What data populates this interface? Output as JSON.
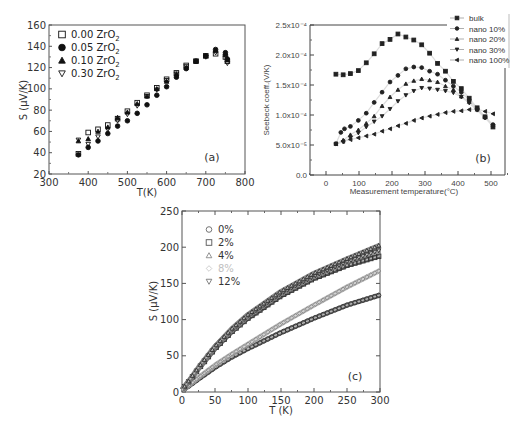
{
  "chart_data": [
    {
      "panel": "(a)",
      "type": "scatter",
      "title": "",
      "xlabel": "T(K)",
      "ylabel": "S (μV/K)",
      "xlim": [
        300,
        800
      ],
      "ylim": [
        20,
        160
      ],
      "xticks": [
        300,
        400,
        500,
        600,
        700,
        800
      ],
      "yticks": [
        20,
        40,
        60,
        80,
        100,
        120,
        140,
        160
      ],
      "grid": false,
      "legend_position": "upper left",
      "series": [
        {
          "name": "0.00 ZrO₂",
          "marker": "open-square",
          "x": [
            375,
            400,
            425,
            450,
            475,
            500,
            525,
            550,
            575,
            600,
            625,
            650,
            675,
            700,
            725,
            750,
            755
          ],
          "y": [
            39,
            59,
            62,
            66,
            72,
            79,
            87,
            94,
            101,
            109,
            115,
            122,
            126,
            131,
            133,
            130,
            126
          ]
        },
        {
          "name": "0.05 ZrO₂",
          "marker": "filled-circle",
          "x": [
            375,
            400,
            425,
            450,
            475,
            500,
            525,
            550,
            575,
            600,
            625,
            650,
            675,
            700,
            725,
            750,
            755
          ],
          "y": [
            38,
            45,
            51,
            58,
            65,
            70,
            77,
            85,
            94,
            102,
            111,
            119,
            126,
            131,
            137,
            134,
            128
          ]
        },
        {
          "name": "0.10 ZrO₂",
          "marker": "filled-triangle",
          "x": [
            375,
            400,
            425,
            450,
            475,
            500,
            525,
            550,
            575,
            600,
            625,
            650,
            675,
            700,
            725,
            750,
            755
          ],
          "y": [
            51,
            53,
            60,
            64,
            73,
            78,
            86,
            93,
            100,
            107,
            114,
            120,
            126,
            131,
            136,
            132,
            127
          ]
        },
        {
          "name": "0.30 ZrO₂",
          "marker": "open-triangle-down",
          "x": [
            375,
            400,
            425,
            450,
            475,
            500,
            525,
            550,
            575,
            600,
            625,
            650,
            675,
            700,
            725,
            750,
            755
          ],
          "y": [
            52,
            48,
            55,
            62,
            70,
            76,
            84,
            93,
            99,
            108,
            114,
            121,
            126,
            130,
            134,
            131,
            124
          ]
        }
      ],
      "annotations": [
        "(a)"
      ]
    },
    {
      "panel": "(b)",
      "type": "scatter",
      "title": "",
      "xlabel": "Measurement temperature(°C)",
      "ylabel": "Seebeck coeff.(V/K)",
      "xlim": [
        -50,
        550
      ],
      "ylim": [
        0,
        0.00025
      ],
      "xticks": [
        "0",
        "100",
        "200",
        "300",
        "400",
        "500"
      ],
      "yticks": [
        "0.0",
        "5.0x10⁻⁵",
        "1.0x10⁻⁴",
        "1.5x10⁻⁴",
        "2.0x10⁻⁴",
        "2.5x10⁻⁴"
      ],
      "grid": false,
      "legend_position": "upper right",
      "series": [
        {
          "name": "bulk",
          "marker": "filled-square",
          "x": [
            30,
            52,
            74,
            98,
            122,
            146,
            170,
            194,
            218,
            242,
            266,
            290,
            314,
            338,
            362,
            386,
            410,
            434,
            458,
            482,
            506
          ],
          "y": [
            0.000168,
            0.000167,
            0.000169,
            0.000174,
            0.000187,
            0.000202,
            0.000219,
            0.000226,
            0.000235,
            0.00023,
            0.000225,
            0.000217,
            0.000203,
            0.000186,
            0.000173,
            0.000156,
            0.000144,
            0.000128,
            0.000112,
            9.7e-05,
            8e-05
          ]
        },
        {
          "name": "nano 10%",
          "marker": "filled-circle",
          "x": [
            30,
            45,
            56,
            74,
            98,
            122,
            146,
            170,
            194,
            218,
            242,
            266,
            290,
            314,
            338,
            362,
            386,
            410,
            434,
            458,
            482,
            506
          ],
          "y": [
            5.2e-05,
            7.1e-05,
            7.7e-05,
            8.1e-05,
            9.1e-05,
            0.000103,
            0.000121,
            0.000138,
            0.000155,
            0.000166,
            0.000177,
            0.00018,
            0.000179,
            0.000173,
            0.000168,
            0.000158,
            0.000148,
            0.000138,
            0.000125,
            0.00011,
            9.6e-05,
            8.4e-05
          ]
        },
        {
          "name": "nano 20%",
          "marker": "filled-triangle",
          "x": [
            30,
            52,
            74,
            98,
            122,
            146,
            170,
            194,
            218,
            242,
            266,
            290,
            314,
            338,
            362,
            386,
            410,
            434,
            458,
            482,
            506
          ],
          "y": [
            5.2e-05,
            5.8e-05,
            6.7e-05,
            7.5e-05,
            8.6e-05,
            9.8e-05,
            0.000115,
            0.00013,
            0.000142,
            0.000152,
            0.000157,
            0.00016,
            0.000158,
            0.000155,
            0.000148,
            0.000142,
            0.000131,
            0.000122,
            0.000109,
            9.7e-05,
            8.3e-05
          ]
        },
        {
          "name": "nano 30%",
          "marker": "filled-triangle-down",
          "x": [
            30,
            52,
            74,
            98,
            122,
            146,
            170,
            194,
            218,
            242,
            266,
            290,
            314,
            338,
            362,
            386,
            410,
            434,
            458,
            482,
            506
          ],
          "y": [
            5.2e-05,
            5.5e-05,
            6.2e-05,
            7e-05,
            8e-05,
            8.9e-05,
            9.8e-05,
            0.00011,
            0.000123,
            0.000133,
            0.00014,
            0.000145,
            0.000144,
            0.000142,
            0.00014,
            0.000137,
            0.00013,
            0.00012,
            0.000108,
            9.5e-05,
            8.2e-05
          ]
        },
        {
          "name": "nano 100%",
          "marker": "filled-triangle-left",
          "x": [
            30,
            52,
            74,
            98,
            122,
            146,
            170,
            194,
            218,
            242,
            266,
            290,
            314,
            338,
            362,
            386,
            410,
            434,
            458,
            482,
            506
          ],
          "y": [
            5.2e-05,
            5.6e-05,
            5.9e-05,
            6.2e-05,
            6.5e-05,
            6.8e-05,
            7.3e-05,
            7.7e-05,
            8.2e-05,
            8.6e-05,
            9.1e-05,
            9.5e-05,
            9.8e-05,
            0.000101,
            0.000104,
            0.000106,
            0.000107,
            0.000109,
            0.00011,
            0.000106,
            0.000102
          ]
        }
      ],
      "annotations": [
        "(b)"
      ]
    },
    {
      "panel": "(c)",
      "type": "scatter",
      "title": "",
      "xlabel": "T (K)",
      "ylabel": "S (μV/K)",
      "xlim": [
        0,
        300
      ],
      "ylim": [
        0,
        250
      ],
      "xticks": [
        0,
        50,
        100,
        150,
        200,
        250,
        300
      ],
      "yticks": [
        0,
        50,
        100,
        150,
        200,
        250
      ],
      "grid": false,
      "legend_position": "upper left",
      "series": [
        {
          "name": "0%",
          "marker": "open-circle",
          "color": "#555555",
          "x": [
            0,
            10,
            25,
            50,
            75,
            100,
            150,
            200,
            250,
            300
          ],
          "y": [
            2,
            8,
            18,
            34,
            48,
            60,
            82,
            102,
            120,
            134
          ]
        },
        {
          "name": "2%",
          "marker": "open-square",
          "color": "#444444",
          "x": [
            0,
            10,
            25,
            50,
            75,
            100,
            150,
            200,
            250,
            300
          ],
          "y": [
            3,
            14,
            32,
            60,
            83,
            102,
            133,
            157,
            175,
            188
          ]
        },
        {
          "name": "4%",
          "marker": "open-triangle",
          "color": "#777777",
          "x": [
            0,
            10,
            25,
            50,
            75,
            100,
            150,
            200,
            250,
            300
          ],
          "y": [
            3,
            15,
            34,
            63,
            87,
            107,
            139,
            164,
            184,
            203
          ]
        },
        {
          "name": "8%",
          "marker": "open-diamond",
          "color": "#aaaaaa",
          "x": [
            0,
            10,
            25,
            50,
            75,
            100,
            150,
            200,
            250,
            300
          ],
          "y": [
            2,
            9,
            20,
            37,
            52,
            66,
            94,
            120,
            145,
            168
          ]
        },
        {
          "name": "12%",
          "marker": "open-triangle-down",
          "color": "#888888",
          "x": [
            0,
            10,
            25,
            50,
            75,
            100,
            150,
            200,
            250,
            300
          ],
          "y": [
            3,
            14,
            33,
            62,
            85,
            105,
            136,
            160,
            180,
            196
          ]
        }
      ],
      "annotations": [
        "(c)"
      ]
    }
  ],
  "panels": {
    "a": {
      "label": "(a)",
      "xlabel": "T(K)",
      "ylabel": "S (μV/K)",
      "legend": [
        "0.00 ZrO",
        "0.05 ZrO",
        "0.10 ZrO",
        "0.30 ZrO"
      ],
      "legend_sub": "2"
    },
    "b": {
      "label": "(b)",
      "xlabel": "Measurement temperature(°C)",
      "ylabel": "Seebeck coeff.(V/K)",
      "legend": [
        "bulk",
        "nano 10%",
        "nano 20%",
        "nano 30%",
        "nano 100%"
      ]
    },
    "c": {
      "label": "(c)",
      "xlabel": "T (K)",
      "ylabel": "S (μV/K)",
      "legend": [
        "0%",
        "2%",
        "4%",
        "8%",
        "12%"
      ]
    }
  }
}
